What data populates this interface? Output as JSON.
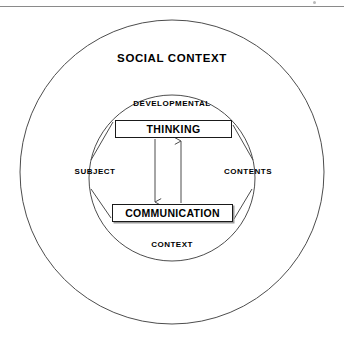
{
  "page": {
    "width": 344,
    "height": 341,
    "background": "#ffffff",
    "rule_color": "#8a8a8a"
  },
  "diagram": {
    "type": "concentric-circles-with-flow",
    "stroke_color": "#4d4d4d",
    "text_color": "#000000",
    "outer_ring": {
      "label": "SOCIAL CONTEXT",
      "cx": 172,
      "cy": 172,
      "r": 152
    },
    "inner_ring": {
      "cx": 172,
      "cy": 178,
      "r": 83,
      "labels": {
        "top": "DEVELOPMENTAL",
        "left": "SUBJECT",
        "right": "CONTENTS",
        "bottom": "CONTEXT"
      }
    },
    "nodes": [
      {
        "id": "thinking",
        "label": "THINKING"
      },
      {
        "id": "communication",
        "label": "COMMUNICATION"
      }
    ],
    "arrows": [
      {
        "from": "thinking",
        "to": "communication",
        "direction": "down"
      },
      {
        "from": "communication",
        "to": "thinking",
        "direction": "up"
      }
    ],
    "connectors": [
      {
        "from": "thinking",
        "toward": "SUBJECT"
      },
      {
        "from": "communication",
        "toward": "SUBJECT"
      },
      {
        "from": "thinking",
        "toward": "CONTENTS"
      },
      {
        "from": "communication",
        "toward": "CONTENTS"
      }
    ]
  }
}
